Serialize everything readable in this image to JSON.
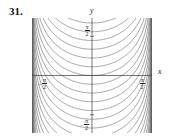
{
  "figure": {
    "exercise_number": "31.",
    "axis_letters": {
      "y": "y",
      "x": "x"
    },
    "tick_labels": {
      "y_top": {
        "sign": "",
        "numerator": "π",
        "denominator": "2"
      },
      "y_bottom": {
        "sign": "−",
        "numerator": "π",
        "denominator": "2"
      },
      "x_left": {
        "sign": "−",
        "numerator": "π",
        "denominator": "2"
      },
      "x_right": {
        "sign": "",
        "numerator": "π",
        "denominator": "2"
      }
    }
  },
  "chart_data": {
    "type": "line",
    "title": "",
    "subtitle": "",
    "xlabel": "x",
    "ylabel": "y",
    "xlim": [
      -1.5707963,
      1.5707963
    ],
    "ylim": [
      -2.3,
      2.3
    ],
    "xticks": [
      -1.5707963,
      1.5707963
    ],
    "xticklabels": [
      "-π/2",
      "π/2"
    ],
    "yticks": [
      -1.5707963,
      1.5707963
    ],
    "yticklabels": [
      "-π/2",
      "π/2"
    ],
    "grid": false,
    "legend": null,
    "axes_style": "centered-cross",
    "line_color": "#555555",
    "line_width": 0.55,
    "series": [
      {
        "name": "C = 2.10",
        "offset": 2.1
      },
      {
        "name": "C = 1.75",
        "offset": 1.75
      },
      {
        "name": "C = 1.40",
        "offset": 1.4
      },
      {
        "name": "C = 1.05",
        "offset": 1.05
      },
      {
        "name": "C = 0.70",
        "offset": 0.7
      },
      {
        "name": "C = 0.35",
        "offset": 0.35
      },
      {
        "name": "C = 0.00",
        "offset": 0.0
      },
      {
        "name": "C = -0.35",
        "offset": -0.35
      },
      {
        "name": "C = -0.70",
        "offset": -0.7
      },
      {
        "name": "C = -1.05",
        "offset": -1.05
      },
      {
        "name": "C = -1.40",
        "offset": -1.4
      },
      {
        "name": "C = -1.75",
        "offset": -1.75
      },
      {
        "name": "C = -2.10",
        "offset": -2.1
      },
      {
        "name": "C = -2.45",
        "offset": -2.45
      },
      {
        "name": "C = -2.80",
        "offset": -2.8
      },
      {
        "name": "C = -3.15",
        "offset": -3.15
      },
      {
        "name": "C = -3.50",
        "offset": -3.5
      },
      {
        "name": "C = -3.85",
        "offset": -3.85
      },
      {
        "name": "C = -4.20",
        "offset": -4.2
      },
      {
        "name": "C = -4.55",
        "offset": -4.55
      },
      {
        "name": "C = -4.90",
        "offset": -4.9
      },
      {
        "name": "C = -5.25",
        "offset": -5.25
      },
      {
        "name": "C = -5.60",
        "offset": -5.6
      },
      {
        "name": "C = -5.95",
        "offset": -5.95
      },
      {
        "name": "C = -6.30",
        "offset": -6.3
      },
      {
        "name": "C = -6.65",
        "offset": -6.65
      },
      {
        "name": "C = -7.00",
        "offset": -7.0
      },
      {
        "name": "C = -7.35",
        "offset": -7.35
      },
      {
        "name": "C = -7.70",
        "offset": -7.7
      },
      {
        "name": "C = -8.05",
        "offset": -8.05
      },
      {
        "name": "C = -8.40",
        "offset": -8.4
      },
      {
        "name": "C = -8.75",
        "offset": -8.75
      },
      {
        "name": "C = -9.10",
        "offset": -9.1
      },
      {
        "name": "C = -9.45",
        "offset": -9.45
      },
      {
        "name": "C = -9.80",
        "offset": -9.8
      },
      {
        "name": "C = -10.15",
        "offset": -10.15
      },
      {
        "name": "C = -10.50",
        "offset": -10.5
      },
      {
        "name": "C = -10.85",
        "offset": -10.85
      },
      {
        "name": "C = -11.20",
        "offset": -11.2
      },
      {
        "name": "C = -11.55",
        "offset": -11.55
      },
      {
        "name": "C = -11.90",
        "offset": -11.9
      },
      {
        "name": "C = -12.25",
        "offset": -12.25
      },
      {
        "name": "C = -12.60",
        "offset": -12.6
      },
      {
        "name": "C = -12.95",
        "offset": -12.95
      },
      {
        "name": "C = -13.30",
        "offset": -13.3
      },
      {
        "name": "C = -13.65",
        "offset": -13.65
      },
      {
        "name": "C = -14.00",
        "offset": -14.0
      },
      {
        "name": "C = -14.35",
        "offset": -14.35
      },
      {
        "name": "C = -14.70",
        "offset": -14.7
      },
      {
        "name": "C = -15.05",
        "offset": -15.05
      },
      {
        "name": "C = -15.40",
        "offset": -15.4
      },
      {
        "name": "C = -15.75",
        "offset": -15.75
      },
      {
        "name": "C = -16.10",
        "offset": -16.1
      },
      {
        "name": "C = -16.45",
        "offset": -16.45
      },
      {
        "name": "C = -16.80",
        "offset": -16.8
      },
      {
        "name": "C = -17.15",
        "offset": -17.15
      },
      {
        "name": "C = -17.50",
        "offset": -17.5
      },
      {
        "name": "C = -17.85",
        "offset": -17.85
      },
      {
        "name": "C = -18.20",
        "offset": -18.2
      },
      {
        "name": "C = -18.55",
        "offset": -18.55
      },
      {
        "name": "C = -18.90",
        "offset": -18.9
      },
      {
        "name": "C = -19.25",
        "offset": -19.25
      },
      {
        "name": "C = -19.60",
        "offset": -19.6
      },
      {
        "name": "C = -19.95",
        "offset": -19.95
      },
      {
        "name": "C = -20.30",
        "offset": -20.3
      },
      {
        "name": "C = -20.65",
        "offset": -20.65
      },
      {
        "name": "C = -21.00",
        "offset": -21.0
      },
      {
        "name": "C = -21.35",
        "offset": -21.35
      },
      {
        "name": "C = -21.70",
        "offset": -21.7
      },
      {
        "name": "C = -22.05",
        "offset": -22.05
      },
      {
        "name": "C = -22.40",
        "offset": -22.4
      },
      {
        "name": "C = -22.75",
        "offset": -22.75
      },
      {
        "name": "C = -23.10",
        "offset": -23.1
      },
      {
        "name": "C = -23.45",
        "offset": -23.45
      },
      {
        "name": "C = -23.80",
        "offset": -23.8
      },
      {
        "name": "C = -24.15",
        "offset": -24.15
      },
      {
        "name": "C = -24.50",
        "offset": -24.5
      },
      {
        "name": "C = -24.85",
        "offset": -24.85
      },
      {
        "name": "C = -25.20",
        "offset": -25.2
      },
      {
        "name": "C = -25.55",
        "offset": -25.55
      }
    ],
    "axis_color": "#3a3a3a",
    "axis_width": 0.7
  }
}
